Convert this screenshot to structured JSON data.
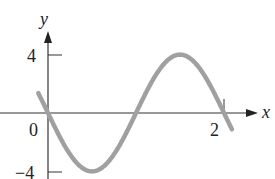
{
  "chart_data": {
    "type": "line",
    "title": "",
    "xlabel": "x",
    "ylabel": "y",
    "function": "y = -4 sin(pi x)",
    "xlim": [
      -0.12,
      2.1
    ],
    "ylim": [
      -4,
      4.8
    ],
    "x_ticks": [
      {
        "value": 2,
        "label": "2"
      }
    ],
    "y_ticks": [
      {
        "value": 4,
        "label": "4"
      },
      {
        "value": -4,
        "label": "-4"
      }
    ],
    "origin_label": "0",
    "grid": false,
    "legend": null,
    "series": [
      {
        "name": "curve",
        "color": "#a0a0a0",
        "x": [
          -0.1,
          0,
          0.25,
          0.5,
          0.75,
          1.0,
          1.25,
          1.5,
          1.75,
          2.0,
          2.08
        ],
        "values": [
          1.24,
          0,
          -2.83,
          -4,
          -2.83,
          0,
          2.83,
          4,
          2.83,
          0,
          -0.99
        ]
      }
    ]
  },
  "labels": {
    "x_axis": "x",
    "y_axis": "y",
    "origin": "0",
    "y_tick_top": "4",
    "y_tick_bottom": "−4",
    "x_tick": "2"
  },
  "colors": {
    "curve": "#a0a0a0",
    "axes": "#333333",
    "text": "#222222"
  }
}
